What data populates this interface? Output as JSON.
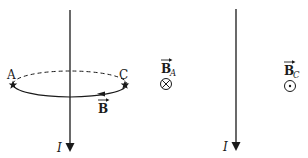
{
  "diagram": {
    "left_panel": {
      "current_label": "I",
      "point_a_label": "A",
      "point_c_label": "C",
      "field_label": "B",
      "field_loop_direction": "counter-clockwise-front-leftward",
      "current_direction": "down"
    },
    "middle": {
      "field_a_label": "B",
      "field_a_subscript": "A",
      "field_a_symbol": "⊗",
      "field_a_symbol_meaning": "into-page"
    },
    "right_panel": {
      "current_label": "I",
      "current_direction": "down",
      "field_c_label": "B",
      "field_c_subscript": "C",
      "field_c_symbol": "⊙",
      "field_c_symbol_meaning": "out-of-page"
    },
    "colors": {
      "ink": "#1a1a1a",
      "background": "#ffffff"
    }
  }
}
